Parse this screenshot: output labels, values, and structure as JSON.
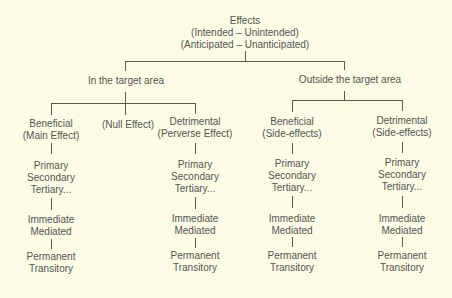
{
  "diagram": {
    "type": "tree",
    "root": {
      "lines": [
        "Effects",
        "(Intended – Unintended)",
        "(Anticipated – Unanticipated)"
      ]
    },
    "branches": [
      {
        "label": "In the target area",
        "children": [
          {
            "lines": [
              "Beneficial",
              "(Main Effect)"
            ],
            "levels": [
              [
                "Primary",
                "Secondary",
                "Tertiary..."
              ],
              [
                "Immediate",
                "Mediated"
              ],
              [
                "Permanent",
                "Transitory"
              ]
            ]
          },
          {
            "lines": [
              "(Null Effect)"
            ],
            "levels": []
          },
          {
            "lines": [
              "Detrimental",
              "(Perverse Effect)"
            ],
            "levels": [
              [
                "Primary",
                "Secondary",
                "Tertiary..."
              ],
              [
                "Immediate",
                "Mediated"
              ],
              [
                "Permanent",
                "Transitory"
              ]
            ]
          }
        ]
      },
      {
        "label": "Outside the target area",
        "children": [
          {
            "lines": [
              "Beneficial",
              "(Side-effects)"
            ],
            "levels": [
              [
                "Primary",
                "Secondary",
                "Tertiary..."
              ],
              [
                "Immediate",
                "Mediated"
              ],
              [
                "Permanent",
                "Transitory"
              ]
            ]
          },
          {
            "lines": [
              "Detrimental",
              "(Side-effects)"
            ],
            "levels": [
              [
                "Primary",
                "Secondary",
                "Tertiary..."
              ],
              [
                "Immediate",
                "Mediated"
              ],
              [
                "Permanent",
                "Transitory"
              ]
            ]
          }
        ]
      }
    ]
  },
  "colors": {
    "background": "#fcfce6",
    "text": "#555550",
    "lines": "#5a5a55"
  }
}
